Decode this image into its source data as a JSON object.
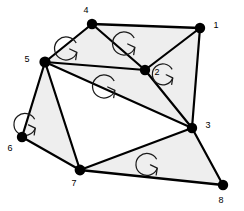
{
  "figure": {
    "background_color": "#ffffff",
    "face_fill_color": "#eeeeee",
    "edge_color": "#000000",
    "node_color": "#000000",
    "loop_color": "#1a1a1a"
  },
  "nodes": [
    {
      "id": "1",
      "label": "1",
      "x": 200,
      "y": 28,
      "r": 5.2,
      "label_x": 216,
      "label_y": 26
    },
    {
      "id": "2",
      "label": "2",
      "x": 145,
      "y": 70,
      "r": 5.2,
      "label_x": 157,
      "label_y": 73
    },
    {
      "id": "3",
      "label": "3",
      "x": 192,
      "y": 128,
      "r": 5.2,
      "label_x": 208,
      "label_y": 126
    },
    {
      "id": "4",
      "label": "4",
      "x": 92,
      "y": 24,
      "r": 5.2,
      "label_x": 86,
      "label_y": 11
    },
    {
      "id": "5",
      "label": "5",
      "x": 45,
      "y": 62,
      "r": 5.6,
      "label_x": 27,
      "label_y": 60
    },
    {
      "id": "6",
      "label": "6",
      "x": 22,
      "y": 137,
      "r": 5.2,
      "label_x": 10,
      "label_y": 149
    },
    {
      "id": "7",
      "label": "7",
      "x": 80,
      "y": 170,
      "r": 5.4,
      "label_x": 74,
      "label_y": 184
    },
    {
      "id": "8",
      "label": "8",
      "x": 223,
      "y": 185,
      "r": 5.2,
      "label_x": 221,
      "label_y": 201
    }
  ],
  "edges": [
    {
      "from": "4",
      "to": "1",
      "width": 2.4
    },
    {
      "from": "4",
      "to": "5",
      "width": 2.2
    },
    {
      "from": "4",
      "to": "2",
      "width": 2.2
    },
    {
      "from": "1",
      "to": "2",
      "width": 2.2
    },
    {
      "from": "1",
      "to": "3",
      "width": 2.2
    },
    {
      "from": "2",
      "to": "5",
      "width": 2.2
    },
    {
      "from": "2",
      "to": "3",
      "width": 2.2
    },
    {
      "from": "5",
      "to": "3",
      "width": 2.0
    },
    {
      "from": "5",
      "to": "6",
      "width": 2.2
    },
    {
      "from": "5",
      "to": "7",
      "width": 2.2
    },
    {
      "from": "6",
      "to": "7",
      "width": 2.2
    },
    {
      "from": "7",
      "to": "3",
      "width": 2.2
    },
    {
      "from": "7",
      "to": "8",
      "width": 2.4
    },
    {
      "from": "3",
      "to": "8",
      "width": 2.2
    }
  ],
  "faces": [
    {
      "name": "face-4-5-2",
      "nodes": [
        "4",
        "5",
        "2"
      ],
      "shaded": true
    },
    {
      "name": "face-4-2-1",
      "nodes": [
        "4",
        "2",
        "1"
      ],
      "shaded": true
    },
    {
      "name": "face-2-3-1",
      "nodes": [
        "2",
        "3",
        "1"
      ],
      "shaded": true
    },
    {
      "name": "face-5-3-2",
      "nodes": [
        "5",
        "3",
        "2"
      ],
      "shaded": true
    },
    {
      "name": "face-5-7-6",
      "nodes": [
        "5",
        "7",
        "6"
      ],
      "shaded": true
    },
    {
      "name": "face-7-8-3",
      "nodes": [
        "7",
        "8",
        "3"
      ],
      "shaded": true
    },
    {
      "name": "face-5-7-3",
      "nodes": [
        "5",
        "7",
        "3"
      ],
      "shaded": false
    }
  ],
  "loops": [
    {
      "name": "loop-face-4-5-2",
      "x": 87,
      "y": 47,
      "r": 11.5,
      "direction": "counterclockwise"
    },
    {
      "name": "loop-face-4-2-1",
      "x": 145,
      "y": 42,
      "r": 11.5,
      "direction": "counterclockwise"
    },
    {
      "name": "loop-face-2-3-1",
      "x": 182,
      "y": 73,
      "r": 10.5,
      "direction": "counterclockwise"
    },
    {
      "name": "loop-face-5-3-2",
      "x": 125,
      "y": 85,
      "r": 11.5,
      "direction": "counterclockwise"
    },
    {
      "name": "loop-face-5-7-6",
      "x": 45,
      "y": 123,
      "r": 11.0,
      "direction": "counterclockwise"
    },
    {
      "name": "loop-face-7-8-3",
      "x": 167,
      "y": 163,
      "r": 11.0,
      "direction": "counterclockwise"
    }
  ]
}
